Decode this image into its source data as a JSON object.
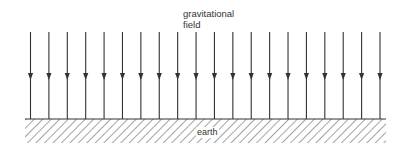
{
  "diagram": {
    "field_label_line1": "gravitational",
    "field_label_line2": "field",
    "ground_label": "earth",
    "arrow_count": 20,
    "arrow_direction": "down",
    "icons": {
      "field_line": "down-arrow-icon",
      "ground": "hatched-ground-icon"
    },
    "colors": {
      "line": "#333333",
      "background": "#ffffff"
    }
  }
}
